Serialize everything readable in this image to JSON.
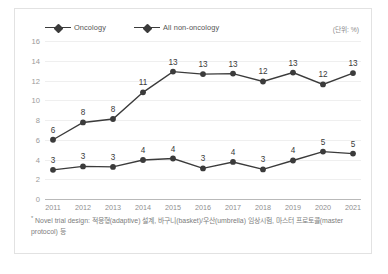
{
  "unit_label": "(단위: %)",
  "footnote": {
    "marker": "*",
    "text": "Novel trial design: 적응형(adaptive) 설계, 바구니(basket)/우산(umbrella) 임상시험, 마스터 프로토콜(master protocol) 등"
  },
  "colors": {
    "series": "#3b3b3b",
    "grid": "#efefef",
    "axis": "#b9b9b9",
    "tick_text": "#9a9a9a",
    "border": "#e2e2e2",
    "background": "#ffffff"
  },
  "chart_data": {
    "type": "line",
    "title": "",
    "xlabel": "",
    "ylabel": "",
    "ylim": [
      0,
      16
    ],
    "yticks": [
      0,
      2,
      4,
      6,
      8,
      10,
      12,
      14,
      16
    ],
    "grid": true,
    "legend_position": "top-left",
    "data_labels": true,
    "categories": [
      "2011",
      "2012",
      "2013",
      "2014",
      "2015",
      "2016",
      "2017",
      "2018",
      "2019",
      "2020",
      "2021"
    ],
    "series": [
      {
        "name": "Oncology",
        "values": [
          6,
          8,
          8,
          11,
          13,
          13,
          13,
          12,
          13,
          12,
          13
        ],
        "plot_values": [
          6.0,
          7.75,
          8.1,
          10.8,
          12.9,
          12.65,
          12.7,
          11.9,
          12.8,
          11.6,
          12.75
        ],
        "labels": [
          "6",
          "8",
          "8",
          "11",
          "13",
          "13",
          "13",
          "12",
          "13",
          "12",
          "13"
        ]
      },
      {
        "name": "All non-oncology",
        "values": [
          3,
          3,
          3,
          4,
          4,
          3,
          4,
          3,
          4,
          5,
          5
        ],
        "plot_values": [
          2.95,
          3.3,
          3.25,
          3.95,
          4.1,
          3.1,
          3.75,
          3.0,
          3.9,
          4.8,
          4.6
        ],
        "labels": [
          "3",
          "3",
          "3",
          "4",
          "4",
          "3",
          "4",
          "3",
          "4",
          "5",
          "5"
        ]
      }
    ]
  }
}
